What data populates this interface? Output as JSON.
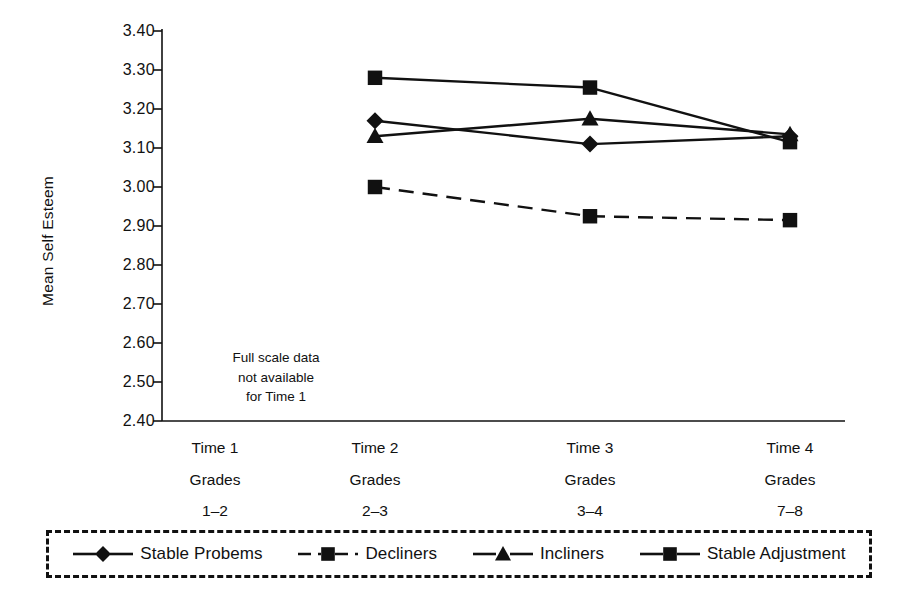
{
  "chart_data": {
    "type": "line",
    "title": "",
    "xlabel": "",
    "ylabel": "Mean Self Esteem",
    "ylim": [
      2.4,
      3.4
    ],
    "ytick_values": [
      3.4,
      3.3,
      3.2,
      3.1,
      3.0,
      2.9,
      2.8,
      2.7,
      2.6,
      2.5,
      2.4
    ],
    "ytick_labels": [
      "3.40",
      "3.30",
      "3.20",
      "3.10",
      "3.00",
      "2.90",
      "2.80",
      "2.70",
      "2.60",
      "2.50",
      "2.40"
    ],
    "grid": false,
    "legend_position": "below-bottom",
    "categories": [
      "Time 1",
      "Time 2",
      "Time 3",
      "Time 4"
    ],
    "xtick_labels": [
      {
        "line1": "Time 1",
        "line2": "Grades",
        "line3": "1–2"
      },
      {
        "line1": "Time 2",
        "line2": "Grades",
        "line3": "2–3"
      },
      {
        "line1": "Time 3",
        "line2": "Grades",
        "line3": "3–4"
      },
      {
        "line1": "Time 4",
        "line2": "Grades",
        "line3": "7–8"
      }
    ],
    "annotations": [
      {
        "text_line1": "Full scale data",
        "text_line2": "not available",
        "text_line3": "for Time 1"
      }
    ],
    "series": [
      {
        "name": "Stable Probems",
        "marker": "diamond",
        "linestyle": "solid",
        "color": "#111111",
        "values": [
          null,
          3.17,
          3.11,
          3.13
        ]
      },
      {
        "name": "Decliners",
        "marker": "square",
        "linestyle": "dashed",
        "color": "#111111",
        "values": [
          null,
          3.0,
          2.925,
          2.915
        ]
      },
      {
        "name": "Incliners",
        "marker": "triangle",
        "linestyle": "solid",
        "color": "#111111",
        "values": [
          null,
          3.13,
          3.175,
          3.135
        ]
      },
      {
        "name": "Stable Adjustment",
        "marker": "square",
        "linestyle": "solid",
        "color": "#111111",
        "values": [
          null,
          3.28,
          3.255,
          3.115
        ]
      }
    ]
  },
  "legend": {
    "items": [
      {
        "label": "Stable Probems",
        "marker": "diamond",
        "linestyle": "solid"
      },
      {
        "label": "Decliners",
        "marker": "square",
        "linestyle": "dashed"
      },
      {
        "label": "Incliners",
        "marker": "triangle",
        "linestyle": "solid"
      },
      {
        "label": "Stable Adjustment",
        "marker": "square",
        "linestyle": "solid"
      }
    ]
  }
}
